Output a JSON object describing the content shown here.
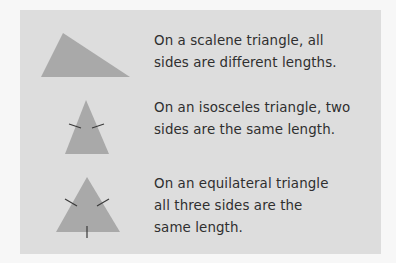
{
  "colors": {
    "background": "#f7f7f7",
    "panel": "#dddddd",
    "triangle_fill": "#a9a9a9",
    "tick_mark": "#3a3a3a",
    "text": "#2f2f2f"
  },
  "rows": [
    {
      "shape": "scalene-triangle",
      "caption": "On a scalene triangle, all\nsides are different lengths.",
      "tick_marks": 0
    },
    {
      "shape": "isosceles-triangle",
      "caption": "On an isosceles triangle, two\nsides are the same length.",
      "tick_marks": 2
    },
    {
      "shape": "equilateral-triangle",
      "caption": "On an equilateral triangle\nall three sides are the\nsame length.",
      "tick_marks": 3
    }
  ]
}
